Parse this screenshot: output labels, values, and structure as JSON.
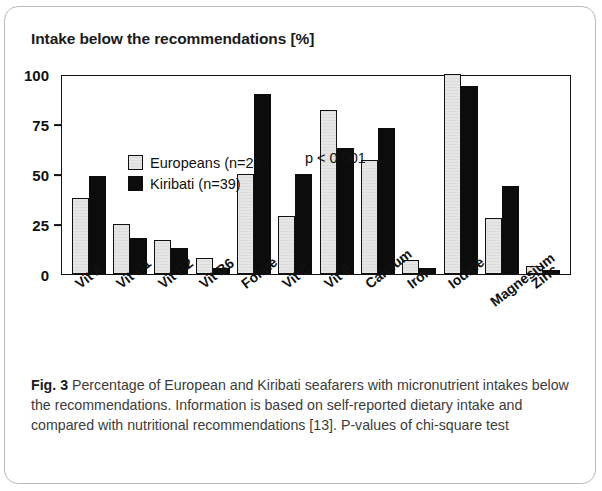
{
  "figure": {
    "title": "Intake below the recommendations [%]",
    "annotation": "p < 0.001",
    "caption_label": "Fig. 3",
    "caption_text": " Percentage of European and Kiribati seafarers with micronutrient intakes below the recommendations. Information is based on self-reported dietary intake and compared with nutritional recommendations [13]. P-values of chi-square test"
  },
  "legend": {
    "items": [
      {
        "label": "Europeans (n=24)",
        "color": "#e4e4e4"
      },
      {
        "label": "Kiribati (n=39)",
        "color": "#0c0c0c"
      }
    ]
  },
  "chart_data": {
    "type": "bar",
    "title": "Intake below the recommendations [%]",
    "xlabel": "",
    "ylabel": "Intake below the recommendations [%]",
    "ylim": [
      0,
      100
    ],
    "yticks": [
      0,
      25,
      50,
      75,
      100
    ],
    "grid": false,
    "legend_position": "top-left",
    "annotations": [
      {
        "text": "p < 0.001",
        "near_category": "Folate"
      }
    ],
    "categories": [
      "Vit A",
      "Vit B1",
      "Vit B2",
      "Vit B6",
      "Folate",
      "Vit C",
      "Vit E",
      "Calcium",
      "Iron",
      "Iodine",
      "Magnesium",
      "Zinc"
    ],
    "series": [
      {
        "name": "Europeans (n=24)",
        "color": "#e4e4e4",
        "values": [
          38,
          25,
          17,
          8,
          50,
          29,
          82,
          57,
          7,
          100,
          28,
          4
        ]
      },
      {
        "name": "Kiribati (n=39)",
        "color": "#0c0c0c",
        "values": [
          49,
          18,
          13,
          3,
          90,
          50,
          63,
          73,
          3,
          94,
          44,
          2
        ]
      }
    ]
  }
}
